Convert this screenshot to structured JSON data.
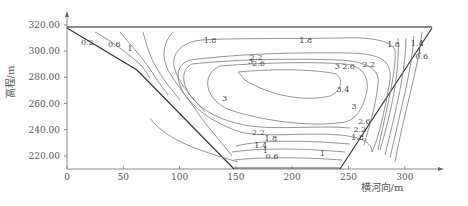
{
  "chart_data": {
    "type": "contour",
    "title": "",
    "xlabel": "横河向/m",
    "ylabel": "高程/m",
    "xlim": [
      0,
      325
    ],
    "ylim": [
      210,
      325
    ],
    "x_ticks": [
      "0",
      "50",
      "100",
      "150",
      "200",
      "250",
      "300"
    ],
    "y_ticks": [
      "220.00",
      "240.00",
      "260.00",
      "280.00",
      "300.00",
      "320.00"
    ],
    "grid": false,
    "legend": null,
    "section_outline": {
      "top_elevation": 318,
      "bottom_elevation": 211,
      "left_crest_x": 0,
      "left_break": {
        "x": 62,
        "y": 285
      },
      "left_toe_x": 148,
      "right_toe_x": 243,
      "right_crest_x": 323
    },
    "contour_levels": [
      0.2,
      0.6,
      1,
      1.4,
      1.8,
      2.2,
      2.6,
      3,
      3.4
    ],
    "contour_labels": [
      {
        "text": "0.2",
        "x": 18,
        "y": 305
      },
      {
        "text": "0.6",
        "x": 42,
        "y": 303
      },
      {
        "text": "1",
        "x": 56,
        "y": 300
      },
      {
        "text": "1.8",
        "x": 127,
        "y": 306
      },
      {
        "text": "1.8",
        "x": 212,
        "y": 306
      },
      {
        "text": "1.8",
        "x": 290,
        "y": 303
      },
      {
        "text": "2.2",
        "x": 168,
        "y": 293
      },
      {
        "text": "2.2",
        "x": 268,
        "y": 288
      },
      {
        "text": "3",
        "x": 163,
        "y": 290
      },
      {
        "text": "2.6",
        "x": 170,
        "y": 289
      },
      {
        "text": "2.6",
        "x": 250,
        "y": 286
      },
      {
        "text": "3",
        "x": 240,
        "y": 286
      },
      {
        "text": "3.4",
        "x": 245,
        "y": 269
      },
      {
        "text": "3",
        "x": 140,
        "y": 262
      },
      {
        "text": "3",
        "x": 255,
        "y": 256
      },
      {
        "text": "2.2",
        "x": 170,
        "y": 236
      },
      {
        "text": "1.8",
        "x": 181,
        "y": 231
      },
      {
        "text": "1.4",
        "x": 172,
        "y": 226
      },
      {
        "text": "1",
        "x": 176,
        "y": 222
      },
      {
        "text": "0.6",
        "x": 182,
        "y": 218
      },
      {
        "text": "1",
        "x": 227,
        "y": 220
      },
      {
        "text": "2.6",
        "x": 264,
        "y": 244
      },
      {
        "text": "2.2",
        "x": 260,
        "y": 238
      },
      {
        "text": "1.8",
        "x": 258,
        "y": 232
      },
      {
        "text": "1.4",
        "x": 311,
        "y": 304
      },
      {
        "text": "1",
        "x": 313,
        "y": 298
      },
      {
        "text": "0.6",
        "x": 315,
        "y": 294
      }
    ]
  }
}
